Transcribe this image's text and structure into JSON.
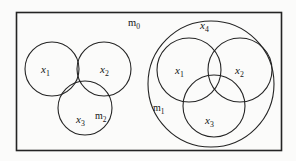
{
  "figure": {
    "background_color": "#fbfbfa",
    "stroke_color": "#242424",
    "frame": {
      "x": 16,
      "y": 12,
      "width": 266,
      "height": 139
    },
    "labels": {
      "m0": "m",
      "m0_sub": "0",
      "m1": "m",
      "m1_sub": "1",
      "m2": "m",
      "m2_sub": "2",
      "x1": "x",
      "x1_sub": "1",
      "x2": "x",
      "x2_sub": "2",
      "x3": "x",
      "x3_sub": "3",
      "x4": "x",
      "x4_sub": "4"
    },
    "left_group": {
      "name": "m2",
      "circles": [
        {
          "id": "left-x1",
          "label": "x1",
          "cx": 52,
          "cy": 69,
          "r": 27
        },
        {
          "id": "left-x2",
          "label": "x2",
          "cx": 104,
          "cy": 69,
          "r": 27
        },
        {
          "id": "left-x3",
          "label": "x3",
          "cx": 85,
          "cy": 108,
          "r": 27
        }
      ],
      "label_positions": {
        "x1": {
          "x": 41,
          "y": 73
        },
        "x2": {
          "x": 104,
          "y": 73
        },
        "x3": {
          "x": 79,
          "y": 123
        },
        "m2": {
          "x": 98,
          "y": 120
        }
      }
    },
    "right_group": {
      "name": "m1",
      "outer_circle": {
        "id": "right-x4",
        "label": "x4",
        "cx": 211,
        "cy": 84,
        "r": 63
      },
      "circles": [
        {
          "id": "right-x1",
          "label": "x1",
          "cx": 189,
          "cy": 70,
          "r": 32
        },
        {
          "id": "right-x2",
          "label": "x2",
          "cx": 240,
          "cy": 70,
          "r": 32
        },
        {
          "id": "right-x3",
          "label": "x3",
          "cx": 214,
          "cy": 106,
          "r": 31
        }
      ],
      "label_positions": {
        "x4": {
          "x": 201,
          "y": 29
        },
        "x1": {
          "x": 176,
          "y": 74
        },
        "x2": {
          "x": 238,
          "y": 74
        },
        "x3": {
          "x": 207,
          "y": 124
        },
        "m1": {
          "x": 156,
          "y": 111
        }
      }
    },
    "universe_label_position": {
      "x": 128,
      "y": 26
    }
  }
}
